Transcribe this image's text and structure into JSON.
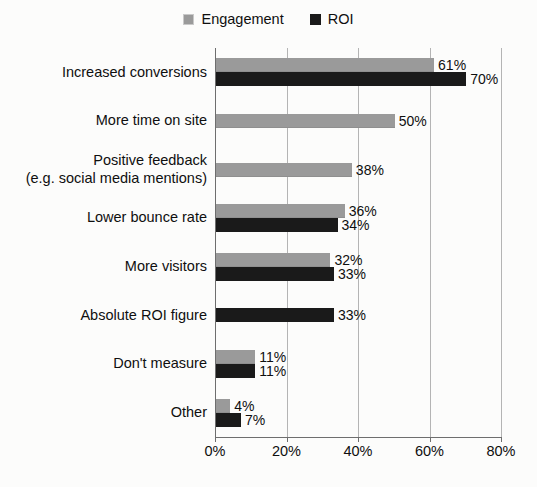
{
  "chart_data": {
    "type": "bar",
    "orientation": "horizontal",
    "title": "",
    "subtitle": "",
    "xlabel": "",
    "ylabel": "",
    "xlim": [
      0,
      80
    ],
    "xticks": [
      0,
      20,
      40,
      60,
      80
    ],
    "xtick_labels": [
      "0%",
      "20%",
      "40%",
      "60%",
      "80%"
    ],
    "grid": true,
    "grid_axis": "x",
    "legend_position": "top-center",
    "value_label_suffix": "%",
    "categories": [
      "Increased conversions",
      "More time on site",
      "Positive feedback (e.g. social media mentions)",
      "Lower bounce rate",
      "More visitors",
      "Absolute ROI figure",
      "Don't measure",
      "Other"
    ],
    "category_lines": [
      [
        "Increased conversions"
      ],
      [
        "More time on site"
      ],
      [
        "Positive feedback",
        "(e.g. social media mentions)"
      ],
      [
        "Lower bounce rate"
      ],
      [
        "More visitors"
      ],
      [
        "Absolute ROI figure"
      ],
      [
        "Don't measure"
      ],
      [
        "Other"
      ]
    ],
    "series": [
      {
        "name": "Engagement",
        "color": "#9a9a9a",
        "values": [
          61,
          50,
          38,
          36,
          32,
          null,
          11,
          4
        ],
        "value_labels": [
          "61%",
          "50%",
          "38%",
          "36%",
          "32%",
          "",
          "11%",
          "4%"
        ]
      },
      {
        "name": "ROI",
        "color": "#1a1a1a",
        "values": [
          70,
          null,
          null,
          34,
          33,
          33,
          11,
          7
        ],
        "value_labels": [
          "70%",
          "",
          "",
          "34%",
          "33%",
          "33%",
          "11%",
          "7%"
        ]
      }
    ]
  },
  "legend": {
    "items": [
      {
        "label": "Engagement",
        "swatch": "legend-swatch-engagement"
      },
      {
        "label": "ROI",
        "swatch": "legend-swatch-roi"
      }
    ]
  },
  "colors": {
    "engagement": "#9a9a9a",
    "roi": "#1a1a1a",
    "gridline": "#b4b4b4",
    "axis": "#6e6e6e",
    "background": "#fcfcfb",
    "text": "#0f0f0f"
  }
}
